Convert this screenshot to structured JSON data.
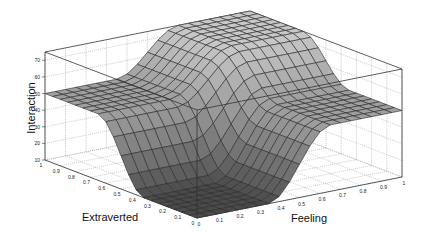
{
  "chart_data": {
    "type": "surface3d",
    "title": "",
    "xlabel": "Feeling",
    "ylabel": "Extraverted",
    "zlabel": "Interaction",
    "x_ticks": [
      0,
      0.1,
      0.2,
      0.3,
      0.4,
      0.5,
      0.6,
      0.7,
      0.8,
      0.9,
      1
    ],
    "y_ticks": [
      0,
      0.1,
      0.2,
      0.3,
      0.4,
      0.5,
      0.6,
      0.7,
      0.8,
      0.9,
      1
    ],
    "z_ticks": [
      10,
      20,
      30,
      40,
      50,
      60,
      70
    ],
    "xlim": [
      0,
      1
    ],
    "ylim": [
      0,
      1
    ],
    "zlim": [
      10,
      75
    ],
    "grid": true,
    "mesh_resolution": 20,
    "corner_values": {
      "feeling0_extraverted0": 10,
      "feeling1_extraverted0": 50,
      "feeling0_extraverted1": 50,
      "feeling1_extraverted1": 75
    },
    "surface_model": {
      "base": 10,
      "feeling_gain": 40,
      "extraverted_gain": 40,
      "interaction_term": -15,
      "transition_center": 0.5,
      "transition_width": 0.3
    },
    "colors": {
      "face_high": "#c8c8c8",
      "face_low": "#4a4a4a",
      "edge": "#2a2a2a",
      "box": "#333333",
      "grid": "#999999"
    }
  }
}
